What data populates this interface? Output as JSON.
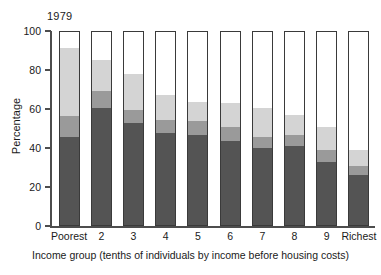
{
  "chart_data": {
    "type": "bar",
    "title": "1979",
    "xlabel": "Income group (tenths of individuals by income before housing costs)",
    "ylabel": "Percentage",
    "ylim": [
      0,
      100
    ],
    "yticks": [
      0,
      20,
      40,
      60,
      80,
      100
    ],
    "grid": false,
    "legend": "none",
    "stacked": true,
    "categories": [
      "Poorest",
      "2",
      "3",
      "4",
      "5",
      "6",
      "7",
      "8",
      "9",
      "Richest"
    ],
    "series": [
      {
        "name": "segment-1-dark",
        "color": "#545454",
        "values": [
          46,
          61,
          53,
          48,
          47,
          44,
          40,
          41,
          33,
          26
        ]
      },
      {
        "name": "segment-2-medium",
        "color": "#9a9a9a",
        "values": [
          11,
          9,
          7,
          7,
          7,
          7,
          6,
          6,
          6,
          5
        ]
      },
      {
        "name": "segment-3-light",
        "color": "#d4d4d4",
        "values": [
          35.5,
          16,
          18.5,
          13,
          10,
          12.5,
          15,
          10.5,
          12,
          8
        ]
      },
      {
        "name": "segment-4-white",
        "color": "#ffffff",
        "values": [
          7.5,
          14,
          21.5,
          32,
          36,
          36.5,
          39,
          42.5,
          49,
          61
        ]
      }
    ],
    "cumulative_tops": [
      [
        46,
        57,
        92.5,
        100
      ],
      [
        61,
        70,
        86,
        100
      ],
      [
        53,
        60,
        78.5,
        100
      ],
      [
        48,
        55,
        68,
        100
      ],
      [
        47,
        54,
        64,
        100
      ],
      [
        44,
        51,
        63.5,
        100
      ],
      [
        40,
        46,
        61,
        100
      ],
      [
        41,
        47,
        57.5,
        100
      ],
      [
        33,
        39,
        51,
        100
      ],
      [
        26,
        31,
        39,
        100
      ]
    ]
  },
  "style": {
    "axis_color": "#4d4d4d",
    "bar_outline": "#3a3a3a",
    "text_color": "#1a1a1a",
    "background": "#ffffff"
  }
}
